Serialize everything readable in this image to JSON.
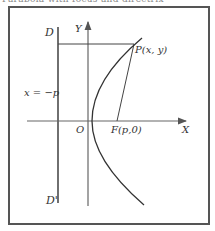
{
  "caption": "Parabola with focus and directrix",
  "labels": {
    "directrix_top": "D",
    "directrix_bottom": "D'",
    "directrix_eq": "x = −p",
    "y_axis": "Y",
    "x_axis": "X",
    "origin": "O",
    "focus": "F(p,0)",
    "point": "P(x, y)"
  },
  "colors": {
    "frame": "#555555",
    "lines": "#333333"
  }
}
